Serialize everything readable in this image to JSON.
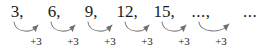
{
  "diagram": {
    "background_color": "#ffffff",
    "text_color": "#1a1a1a",
    "arrow_color": "#808080",
    "terms": [
      {
        "label": "3,",
        "x": 8,
        "width": 18
      },
      {
        "label": "6,",
        "x": 45,
        "width": 18
      },
      {
        "label": "9,",
        "x": 82,
        "width": 18
      },
      {
        "label": "12,",
        "x": 115,
        "width": 24
      },
      {
        "label": "15,",
        "x": 152,
        "width": 24
      },
      {
        "label": "...,",
        "x": 189,
        "width": 24
      },
      {
        "label": "...",
        "x": 239,
        "width": 22
      }
    ],
    "steps": [
      {
        "label": "+3",
        "x": 23,
        "from_term": 0,
        "to_term": 1
      },
      {
        "label": "+3",
        "x": 60,
        "from_term": 1,
        "to_term": 2
      },
      {
        "label": "+3",
        "x": 97,
        "from_term": 2,
        "to_term": 3
      },
      {
        "label": "+3",
        "x": 134,
        "from_term": 3,
        "to_term": 4
      },
      {
        "label": "+3",
        "x": 171,
        "from_term": 4,
        "to_term": 5
      },
      {
        "label": "+3",
        "x": 208,
        "from_term": 5,
        "to_term": 6
      }
    ],
    "arcs": [
      {
        "path": "M 14 22 C 15 33, 33 34, 38 25"
      },
      {
        "path": "M 51 22 C 52 33, 70 34, 75 25"
      },
      {
        "path": "M 88 22 C 89 33, 107 34, 112 25"
      },
      {
        "path": "M 125 22 C 126 33, 144 34, 149 25"
      },
      {
        "path": "M 162 22 C 163 33, 181 34, 186 25"
      },
      {
        "path": "M 199 22 C 200 33, 222 34, 229 24"
      }
    ],
    "arrowheads": [
      {
        "x": 38,
        "y": 25,
        "angle": -52
      },
      {
        "x": 75,
        "y": 25,
        "angle": -52
      },
      {
        "x": 112,
        "y": 25,
        "angle": -52
      },
      {
        "x": 149,
        "y": 25,
        "angle": -52
      },
      {
        "x": 186,
        "y": 25,
        "angle": -52
      },
      {
        "x": 229,
        "y": 24,
        "angle": -48
      }
    ],
    "sequence_data": {
      "type": "arithmetic",
      "first_term": 3,
      "common_difference": 3,
      "shown_values": [
        3,
        6,
        9,
        12,
        15
      ],
      "continues": true
    }
  }
}
